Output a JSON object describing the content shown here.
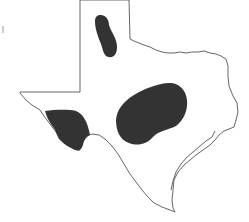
{
  "map": {
    "title": "Texas distribution map",
    "state": "Texas",
    "region_color": "#333333",
    "outline_color": "#555555",
    "background_color": "#ffffff",
    "regions": [
      {
        "id": "panhandle",
        "label": "Panhandle range"
      },
      {
        "id": "central",
        "label": "Central Texas range"
      },
      {
        "id": "trans-pecos",
        "label": "Trans-Pecos range"
      }
    ]
  }
}
